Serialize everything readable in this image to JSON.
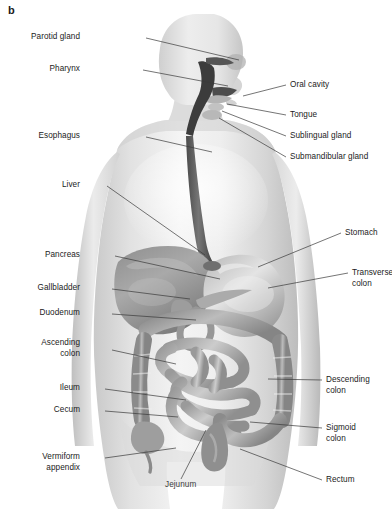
{
  "figure": {
    "panel_letter": "b",
    "background_color": "#ffffff",
    "label_color": "#1b1b1b",
    "leader_line_color": "#3a3a3a"
  },
  "labels_left": [
    {
      "name": "parotid-gland",
      "text": "Parotid gland",
      "x": 80,
      "y": 32,
      "lx": 146,
      "ly": 38,
      "tx": 239,
      "ty": 60
    },
    {
      "name": "pharynx",
      "text": "Pharynx",
      "x": 80,
      "y": 64,
      "lx": 143,
      "ly": 70,
      "tx": 228,
      "ty": 86
    },
    {
      "name": "esophagus",
      "text": "Esophagus",
      "x": 80,
      "y": 131,
      "lx": 146,
      "ly": 137,
      "tx": 212,
      "ty": 152
    },
    {
      "name": "liver",
      "text": "Liver",
      "x": 80,
      "y": 180,
      "lx": 107,
      "ly": 186,
      "tx": 205,
      "ty": 255
    },
    {
      "name": "pancreas",
      "text": "Pancreas",
      "x": 80,
      "y": 250,
      "lx": 115,
      "ly": 256,
      "tx": 220,
      "ty": 279
    },
    {
      "name": "gallbladder",
      "text": "Gallbladder",
      "x": 80,
      "y": 283,
      "lx": 112,
      "ly": 289,
      "tx": 190,
      "ty": 299
    },
    {
      "name": "duodenum",
      "text": "Duodenum",
      "x": 80,
      "y": 308,
      "lx": 112,
      "ly": 314,
      "tx": 196,
      "ty": 320
    },
    {
      "name": "ascending-colon",
      "text": "Ascending\ncolon",
      "x": 80,
      "y": 338,
      "lx": 112,
      "ly": 350,
      "tx": 176,
      "ty": 364
    },
    {
      "name": "ileum",
      "text": "Ileum",
      "x": 80,
      "y": 383,
      "lx": 105,
      "ly": 389,
      "tx": 186,
      "ty": 400
    },
    {
      "name": "cecum",
      "text": "Cecum",
      "x": 80,
      "y": 405,
      "lx": 105,
      "ly": 411,
      "tx": 178,
      "ty": 417
    },
    {
      "name": "vermiform-appendix",
      "text": "Vermiform\nappendix",
      "x": 80,
      "y": 452,
      "lx": 105,
      "ly": 458,
      "tx": 176,
      "ty": 448
    }
  ],
  "labels_right": [
    {
      "name": "oral-cavity",
      "text": "Oral cavity",
      "x": 290,
      "y": 80,
      "lx": 286,
      "ly": 85,
      "tx": 243,
      "ty": 96
    },
    {
      "name": "tongue",
      "text": "Tongue",
      "x": 290,
      "y": 110,
      "lx": 286,
      "ly": 115,
      "tx": 227,
      "ty": 104
    },
    {
      "name": "sublingual-gland",
      "text": "Sublingual gland",
      "x": 290,
      "y": 131,
      "lx": 286,
      "ly": 136,
      "tx": 222,
      "ty": 111
    },
    {
      "name": "submandibular-gland",
      "text": "Submandibular gland",
      "x": 290,
      "y": 152,
      "lx": 286,
      "ly": 157,
      "tx": 219,
      "ty": 118
    },
    {
      "name": "stomach",
      "text": "Stomach",
      "x": 345,
      "y": 228,
      "lx": 341,
      "ly": 233,
      "tx": 258,
      "ty": 267
    },
    {
      "name": "transverse-colon",
      "text": "Transverse\ncolon",
      "x": 352,
      "y": 268,
      "lx": 348,
      "ly": 273,
      "tx": 268,
      "ty": 288
    },
    {
      "name": "descending-colon",
      "text": "Descending\ncolon",
      "x": 326,
      "y": 375,
      "lx": 322,
      "ly": 380,
      "tx": 268,
      "ty": 379
    },
    {
      "name": "sigmoid-colon",
      "text": "Sigmoid\ncolon",
      "x": 326,
      "y": 423,
      "lx": 322,
      "ly": 428,
      "tx": 250,
      "ty": 422
    },
    {
      "name": "rectum",
      "text": "Rectum",
      "x": 326,
      "y": 475,
      "lx": 322,
      "ly": 480,
      "tx": 240,
      "ty": 449
    }
  ],
  "labels_center": [
    {
      "name": "jejunum",
      "text": "Jejunum",
      "x": 165,
      "y": 480,
      "lx": 181,
      "ly": 479,
      "tx": 206,
      "ty": 430
    }
  ]
}
